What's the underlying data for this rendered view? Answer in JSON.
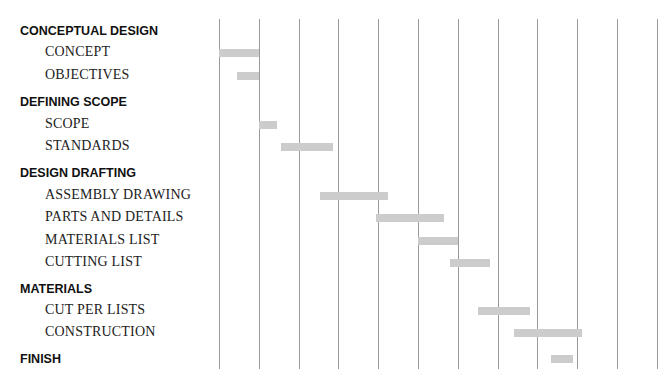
{
  "chart_data": {
    "type": "gantt",
    "title": "",
    "xlabel": "",
    "ylabel": "",
    "grid": true,
    "x_units": "time periods (unlabeled)",
    "xlim": [
      0,
      11
    ],
    "grid_positions": [
      0,
      1,
      2,
      3,
      4,
      5,
      6,
      7,
      8,
      9,
      10,
      11
    ],
    "rows": [
      {
        "type": "category",
        "label": "CONCEPTUAL DESIGN",
        "y": 31
      },
      {
        "type": "task",
        "label": "CONCEPT",
        "y": 53,
        "start": 0.0,
        "end": 1.0,
        "bar_y": 49
      },
      {
        "type": "task",
        "label": "OBJECTIVES",
        "y": 76,
        "start": 0.45,
        "end": 1.0,
        "bar_y": 72
      },
      {
        "type": "category",
        "label": "DEFINING SCOPE",
        "y": 102
      },
      {
        "type": "task",
        "label": "SCOPE",
        "y": 125,
        "start": 1.0,
        "end": 1.45,
        "bar_y": 121
      },
      {
        "type": "task",
        "label": "STANDARDS",
        "y": 147,
        "start": 1.55,
        "end": 2.85,
        "bar_y": 143
      },
      {
        "type": "category",
        "label": "DESIGN DRAFTING",
        "y": 173
      },
      {
        "type": "task",
        "label": "ASSEMBLY DRAWING",
        "y": 196,
        "start": 2.55,
        "end": 4.25,
        "bar_y": 192
      },
      {
        "type": "task",
        "label": "PARTS AND DETAILS",
        "y": 218,
        "start": 3.95,
        "end": 5.65,
        "bar_y": 214
      },
      {
        "type": "task",
        "label": "MATERIALS LIST",
        "y": 241,
        "start": 5.0,
        "end": 6.0,
        "bar_y": 237
      },
      {
        "type": "task",
        "label": "CUTTING LIST",
        "y": 263,
        "start": 5.8,
        "end": 6.8,
        "bar_y": 259
      },
      {
        "type": "category",
        "label": "MATERIALS",
        "y": 289
      },
      {
        "type": "task",
        "label": "CUT PER LISTS",
        "y": 311,
        "start": 6.5,
        "end": 7.8,
        "bar_y": 307
      },
      {
        "type": "task",
        "label": "CONSTRUCTION",
        "y": 333,
        "start": 7.4,
        "end": 9.1,
        "bar_y": 329
      },
      {
        "type": "category",
        "label": "FINISH",
        "y": 359,
        "start": 8.35,
        "end": 8.9,
        "bar_y": 355
      }
    ]
  },
  "colors": {
    "bar": "#cccccc",
    "grid": "#9a9a9a",
    "text": "#222222"
  }
}
